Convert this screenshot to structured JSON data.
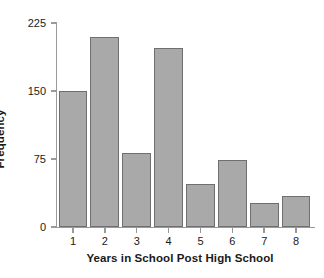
{
  "chart_data": {
    "type": "bar",
    "title": "",
    "subtitle": "",
    "xlabel": "Years in School Post High School",
    "ylabel": "Frequency",
    "categories": [
      "1",
      "2",
      "3",
      "4",
      "5",
      "6",
      "7",
      "8"
    ],
    "values": [
      150,
      210,
      82,
      197,
      47,
      74,
      26,
      34
    ],
    "series": [
      {
        "name": "Frequency",
        "values": [
          150,
          210,
          82,
          197,
          47,
          74,
          26,
          34
        ]
      }
    ],
    "ylim": [
      0,
      225
    ],
    "ytick_labels": [
      "0",
      "75",
      "150",
      "225"
    ],
    "ytick_values": [
      0,
      75,
      150,
      225
    ],
    "xtick_labels": [
      "1",
      "2",
      "3",
      "4",
      "5",
      "6",
      "7",
      "8"
    ],
    "grid": false,
    "legend": false,
    "legend_position": "none",
    "bar_fill_color": "#a9a9a9",
    "bar_edge_color": "#6f6f6f",
    "axis_color": "#9a9a9a",
    "text_color": "#1a1a1a",
    "background_color": "#ffffff"
  }
}
